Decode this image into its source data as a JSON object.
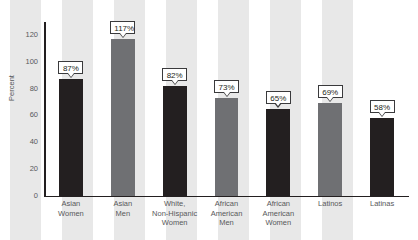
{
  "chart_data": {
    "type": "bar",
    "title": "",
    "subtitle": "",
    "xlabel": "",
    "ylabel": "Percent",
    "ylim": [
      0,
      130
    ],
    "yticks": [
      0,
      20,
      40,
      60,
      80,
      100,
      120
    ],
    "ytick_labels": [
      "0",
      "20",
      "40",
      "60",
      "80",
      "100",
      "120"
    ],
    "grid": false,
    "legend": null,
    "categories": [
      "Asian Women",
      "Asian Men",
      "White, Non-Hispanic Women",
      "African American Men",
      "African American Women",
      "Latinos",
      "Latinas"
    ],
    "category_lines": [
      [
        "Asian",
        "Women"
      ],
      [
        "Asian",
        "Men"
      ],
      [
        "White,",
        "Non-Hispanic",
        "Women"
      ],
      [
        "African",
        "American",
        "Men"
      ],
      [
        "African",
        "American",
        "Women"
      ],
      [
        "Latinos"
      ],
      [
        "Latinas"
      ]
    ],
    "values": [
      87,
      117,
      82,
      73,
      65,
      69,
      58
    ],
    "data_labels": [
      "87%",
      "117%",
      "82%",
      "73%",
      "65%",
      "69%",
      "58%"
    ],
    "bar_colors": [
      "dark",
      "gray",
      "dark",
      "gray",
      "dark",
      "gray",
      "dark"
    ],
    "colors": {
      "dark_bar": "#231f20",
      "gray_bar": "#6f7073",
      "band": "#e8e8e8",
      "axis": "#231f20",
      "text": "#58595b",
      "callout_bg": "#ffffff",
      "callout_border": "#3a3a3c",
      "background": "#ffffff"
    }
  }
}
